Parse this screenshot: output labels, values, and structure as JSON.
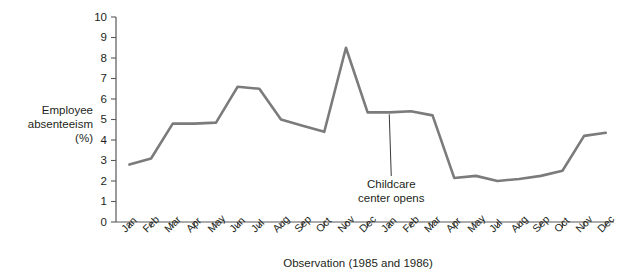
{
  "chart_data": {
    "type": "line",
    "title": "",
    "xlabel": "Observation (1985 and 1986)",
    "ylabel": "Employee absenteeism (%)",
    "ylabel_lines": [
      "Employee",
      "absenteeism",
      "(%)"
    ],
    "ylim": [
      0,
      10
    ],
    "ytick_labels": [
      "0",
      "1",
      "2",
      "3",
      "4",
      "5",
      "6",
      "7",
      "8",
      "9",
      "10"
    ],
    "ytick_values": [
      0,
      1,
      2,
      3,
      4,
      5,
      6,
      7,
      8,
      9,
      10
    ],
    "grid": false,
    "legend": null,
    "categories": [
      "Jan",
      "Feb",
      "Mar",
      "Apr",
      "May",
      "Jun",
      "Jul",
      "Aug",
      "Sep",
      "Oct",
      "Nov",
      "Dec",
      "Jan",
      "Feb",
      "Mar",
      "Apr",
      "May",
      "Jul",
      "Aug",
      "Sep",
      "Oct",
      "Nov",
      "Dec"
    ],
    "values": [
      2.8,
      3.1,
      4.8,
      4.8,
      4.85,
      6.6,
      6.5,
      5.0,
      4.7,
      4.4,
      8.5,
      5.35,
      5.35,
      5.4,
      5.2,
      2.15,
      2.25,
      2.0,
      2.1,
      2.25,
      2.5,
      4.2,
      4.35
    ],
    "annotations": [
      {
        "text": "Childcare center opens",
        "lines": [
          "Childcare",
          "center opens"
        ],
        "points_to_category_index": 12
      }
    ],
    "line_color": "#7b7b7b",
    "axis_color": "#58595b",
    "text_color": "#231f20"
  }
}
